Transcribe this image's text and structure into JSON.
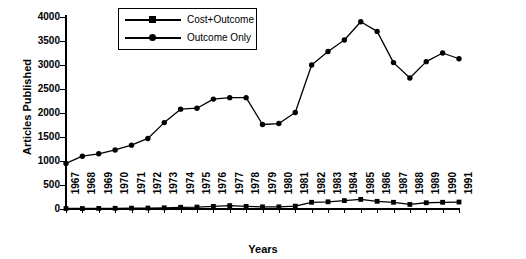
{
  "chart_data": {
    "type": "line",
    "title": "",
    "xlabel": "Years",
    "ylabel": "Articles Published",
    "x": [
      1967,
      1968,
      1969,
      1970,
      1971,
      1972,
      1973,
      1974,
      1975,
      1976,
      1977,
      1978,
      1979,
      1980,
      1981,
      1982,
      1983,
      1984,
      1985,
      1986,
      1987,
      1988,
      1989,
      1990,
      1991
    ],
    "categories": [
      "1967",
      "1968",
      "1969",
      "1970",
      "1971",
      "1972",
      "1973",
      "1974",
      "1975",
      "1976",
      "1977",
      "1978",
      "1979",
      "1980",
      "1981",
      "1982",
      "1983",
      "1984",
      "1985",
      "1986",
      "1987",
      "1988",
      "1989",
      "1990",
      "1991"
    ],
    "xlim": [
      1967,
      1991
    ],
    "ylim": [
      0,
      4000
    ],
    "yticks": [
      0,
      500,
      1000,
      1500,
      2000,
      2500,
      3000,
      3500,
      4000
    ],
    "ytick_labels": [
      "0",
      "500",
      "1000",
      "1500",
      "2000",
      "2500",
      "3000",
      "3500",
      "4000"
    ],
    "grid": false,
    "legend_position": "top-center",
    "series": [
      {
        "name": "Cost+Outcome",
        "marker": "square",
        "color": "#000000",
        "values": [
          10,
          10,
          12,
          15,
          18,
          20,
          25,
          35,
          40,
          55,
          70,
          55,
          45,
          45,
          60,
          140,
          150,
          175,
          200,
          160,
          140,
          95,
          130,
          140,
          145
        ]
      },
      {
        "name": "Outcome Only",
        "marker": "circle",
        "color": "#000000",
        "values": [
          950,
          1100,
          1150,
          1230,
          1330,
          1470,
          1800,
          2080,
          2100,
          2290,
          2320,
          2320,
          1760,
          1780,
          2010,
          3000,
          3280,
          3520,
          3900,
          3700,
          3050,
          2730,
          3070,
          3250,
          3130
        ]
      }
    ]
  },
  "legend": {
    "items": [
      {
        "label": "Cost+Outcome",
        "marker": "square"
      },
      {
        "label": "Outcome Only",
        "marker": "circle"
      }
    ]
  },
  "axes": {
    "y_title": "Articles Published",
    "x_title": "Years"
  }
}
